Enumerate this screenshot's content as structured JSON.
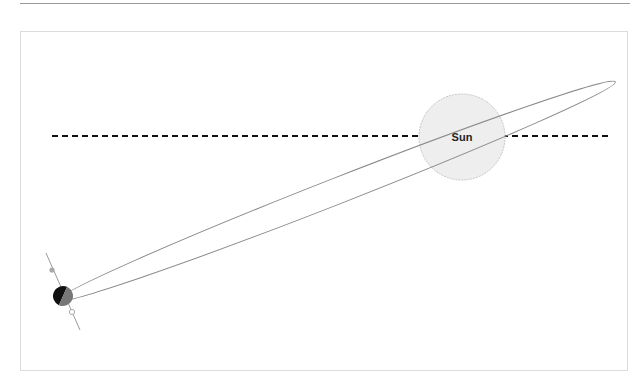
{
  "diagram": {
    "sun": {
      "label": "Sun",
      "fill": "#eeeeee",
      "stroke": "#c8c8c8"
    },
    "reference_line": {
      "style": "dashed",
      "color": "#111111"
    },
    "orbit": {
      "shape": "ellipse",
      "stroke": "#8a8a8a"
    },
    "body": {
      "dark_half": "#111111",
      "light_half": "#777777"
    },
    "axis_markers": {
      "upper": "filled-dot",
      "lower": "open-dot"
    }
  }
}
